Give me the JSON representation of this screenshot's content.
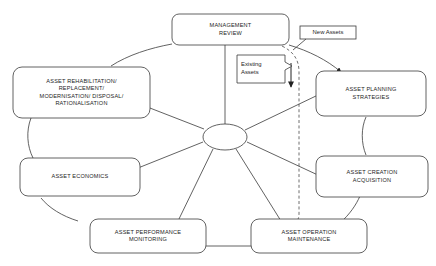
{
  "diagram": {
    "title_fragment": "",
    "nodes": [
      {
        "id": "management-review",
        "label": "MANAGEMENT\nREVIEW"
      },
      {
        "id": "asset-planning",
        "label": "ASSET PLANNING\nSTRATEGIES"
      },
      {
        "id": "asset-creation",
        "label": "ASSET CREATION\nACQUISITION"
      },
      {
        "id": "asset-operation",
        "label": "ASSET OPERATION\nMAINTENANCE"
      },
      {
        "id": "asset-performance",
        "label": "ASSET PERFORMANCE\nMONITORING"
      },
      {
        "id": "asset-economics",
        "label": "ASSET ECONOMICS"
      },
      {
        "id": "asset-rehabilitation",
        "label": "ASSET REHABILITATION/\nREPLACEMENT/\nMODERNISATION/ DISPOSAL/\nRATIONALISATION"
      }
    ],
    "callouts": [
      {
        "id": "new-assets",
        "label": "New Assets"
      },
      {
        "id": "existing-assets",
        "label": "Existing\nAssets"
      }
    ],
    "hub": {
      "id": "central-hub",
      "label": ""
    },
    "colors": {
      "stroke": "#3a3a3a",
      "background": "#ffffff",
      "text": "#1d1d1d",
      "dashed": "#4a4a4a"
    }
  }
}
